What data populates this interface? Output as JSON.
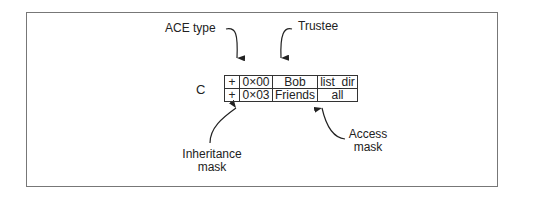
{
  "diagram": {
    "object_label": "C",
    "callouts": {
      "ace_type": "ACE type",
      "trustee": "Trustee",
      "inheritance_mask": [
        "Inheritance",
        "mask"
      ],
      "access_mask": [
        "Access",
        "mask"
      ]
    },
    "acl": {
      "rows": [
        {
          "flag": "+",
          "mask": "0×00",
          "trustee": "Bob",
          "access": "list_dir"
        },
        {
          "flag": "+",
          "mask": "0×03",
          "trustee": "Friends",
          "access": "all"
        }
      ]
    },
    "colors": {
      "line": "#333333",
      "frame": "#777777",
      "text": "#222222"
    }
  }
}
